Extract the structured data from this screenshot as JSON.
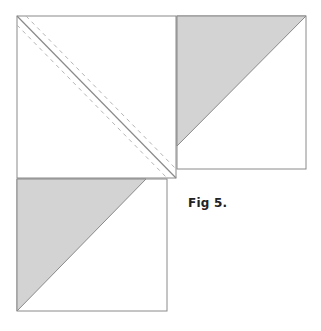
{
  "figure": {
    "caption": "Fig 5.",
    "colors": {
      "outline": "#8a8a8a",
      "fill_shaded": "#d3d3d3",
      "background": "#ffffff",
      "seam_line": "#8a8a8a",
      "dashed_line": "#b5b5b5"
    },
    "squares": [
      {
        "id": "top-left-square",
        "x": 17,
        "y": 16,
        "width": 159,
        "height": 162,
        "diagonal": {
          "from": [
            17,
            16
          ],
          "to": [
            176,
            178
          ]
        },
        "dashed_offsets_px": 6,
        "shaded_triangle": null
      },
      {
        "id": "top-right-square",
        "x": 177,
        "y": 16,
        "width": 129,
        "height": 153,
        "shaded_triangle": [
          [
            177,
            16
          ],
          [
            306,
            16
          ],
          [
            177,
            146
          ]
        ]
      },
      {
        "id": "bottom-left-square",
        "x": 17,
        "y": 179,
        "width": 150,
        "height": 132,
        "shaded_triangle": [
          [
            17,
            179
          ],
          [
            146,
            179
          ],
          [
            17,
            311
          ]
        ]
      }
    ]
  }
}
